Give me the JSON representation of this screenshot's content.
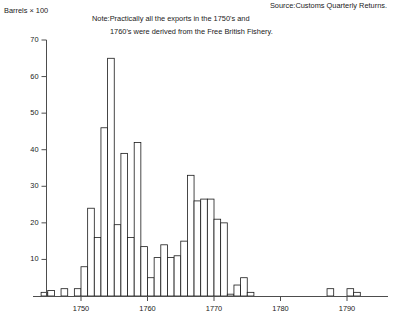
{
  "source_text": "Source:Customs Quarterly Returns.",
  "note_line1": "Note:Practically all the exports in the 1750's and",
  "note_line2": "1760's were derived from the Free British Fishery.",
  "axis": {
    "y_label": "Barrels × 100",
    "y_ticks": [
      "10",
      "20",
      "30",
      "40",
      "50",
      "60",
      "70"
    ],
    "x_ticks": [
      "1750",
      "1760",
      "1770",
      "1780",
      "1790"
    ]
  },
  "colors": {
    "axis": "#4d4d4d",
    "bar_stroke": "#1a1a1a",
    "bar_fill": "#ffffff",
    "text": "#1a1a1a",
    "background": "#ffffff"
  },
  "chart_data": {
    "type": "bar",
    "title": "",
    "subtitle": "",
    "xlabel": "",
    "ylabel": "Barrels × 100",
    "xlim": [
      1743,
      1793
    ],
    "ylim": [
      0,
      70
    ],
    "grid": false,
    "legend": null,
    "annotations": [
      "Source:Customs Quarterly Returns.",
      "Note:Practically all the exports in the 1750's and 1760's were derived from the Free British Fishery."
    ],
    "categories": [
      1744,
      1745,
      1746,
      1747,
      1748,
      1749,
      1750,
      1751,
      1752,
      1753,
      1754,
      1755,
      1756,
      1757,
      1758,
      1759,
      1760,
      1761,
      1762,
      1763,
      1764,
      1765,
      1766,
      1767,
      1768,
      1769,
      1770,
      1771,
      1772,
      1773,
      1774,
      1775,
      1787,
      1790,
      1791
    ],
    "values": [
      1,
      1.5,
      0,
      2,
      0,
      2,
      8,
      24,
      16,
      46,
      65,
      19.5,
      39,
      16,
      42,
      13.5,
      5,
      10.5,
      14,
      10.5,
      11,
      15,
      33,
      26,
      26.5,
      26.5,
      21,
      20,
      0.5,
      3,
      5,
      1,
      2,
      2,
      1
    ]
  }
}
